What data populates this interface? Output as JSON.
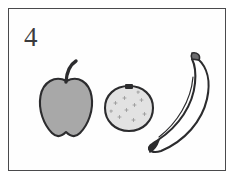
{
  "card": {
    "number_label": "4",
    "frame_color": "#4a4a4c",
    "background_color": "#fefefe",
    "page_background_color": "#ffffff",
    "ink_color": "#3b3b3d"
  },
  "illustration": {
    "subject": "fruit",
    "style": "hand-drawn line art with flat gray shading",
    "item_count": 3,
    "items": [
      {
        "name": "apple",
        "icon": "apple-icon",
        "fill_color": "#a8a8a8",
        "outline_color": "#2c2c2e",
        "details": "curved stem at top, notched bottom"
      },
      {
        "name": "orange",
        "icon": "orange-icon",
        "fill_color": "#e2e2e2",
        "outline_color": "#2c2c2e",
        "details": "speckled peel texture, dark navel mark at top"
      },
      {
        "name": "banana",
        "icon": "banana-icon",
        "fill_color": "#ffffff",
        "outline_color": "#2c2c2e",
        "details": "crescent curve, inner crease line, dark blossom tip at bottom"
      }
    ]
  }
}
